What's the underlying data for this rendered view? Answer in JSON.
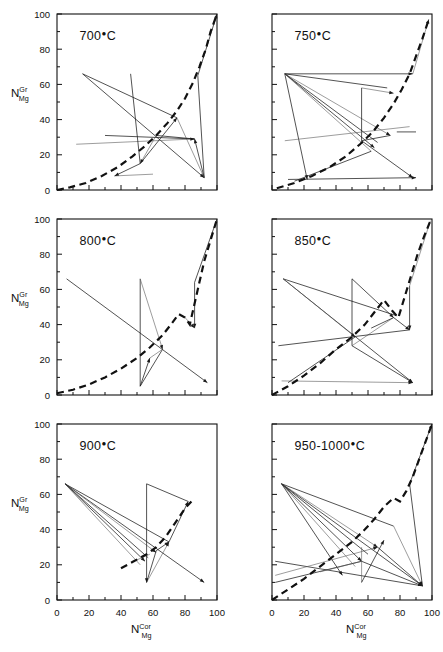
{
  "figure": {
    "axis_labels": {
      "y_base": "N",
      "y_sup": "Gr",
      "y_sub": "Mg",
      "x_base": "N",
      "x_sup": "Cor",
      "x_sub": "Mg"
    },
    "tick_values": [
      0,
      20,
      40,
      60,
      80,
      100
    ],
    "axis_range": [
      0,
      100
    ],
    "line_color": "#111111",
    "panels": [
      {
        "id": "p700",
        "label": "700",
        "unit": "°C",
        "row": 0,
        "col": 0
      },
      {
        "id": "p750",
        "label": "750",
        "unit": "°C",
        "row": 0,
        "col": 1
      },
      {
        "id": "p800",
        "label": "800",
        "unit": "°C",
        "row": 1,
        "col": 0
      },
      {
        "id": "p850",
        "label": "850",
        "unit": "°C",
        "row": 1,
        "col": 1
      },
      {
        "id": "p900",
        "label": "900",
        "unit": "°C",
        "row": 2,
        "col": 0
      },
      {
        "id": "p9501000",
        "label": "950-1000",
        "unit": "°C",
        "row": 2,
        "col": 1
      }
    ]
  },
  "chart_data": {
    "type": "scatter",
    "title": "",
    "xlabel": "N_Mg^Cor",
    "ylabel": "N_Mg^Gr",
    "xlim": [
      0,
      100
    ],
    "ylim": [
      0,
      100
    ],
    "grid": false,
    "legend": "none",
    "panels": [
      {
        "temperature_label": "700°C",
        "binodal": [
          [
            0,
            0
          ],
          [
            8,
            1.5
          ],
          [
            18,
            4
          ],
          [
            28,
            8
          ],
          [
            38,
            13
          ],
          [
            47,
            19
          ],
          [
            55,
            25
          ],
          [
            62,
            31
          ],
          [
            69,
            38
          ],
          [
            75,
            45
          ],
          [
            80,
            52
          ],
          [
            85,
            61
          ],
          [
            89,
            70
          ],
          [
            93,
            80
          ],
          [
            96,
            90
          ],
          [
            100,
            100
          ]
        ],
        "tielines": [
          [
            [
              16,
              66
            ],
            [
              92,
              7
            ]
          ],
          [
            [
              16,
              66
            ],
            [
              75,
              41
            ]
          ],
          [
            [
              12,
              26
            ],
            [
              86,
              29
            ]
          ],
          [
            [
              46,
              66
            ],
            [
              52,
              15
            ]
          ],
          [
            [
              52,
              15
            ],
            [
              75,
              41
            ]
          ],
          [
            [
              75,
              41
            ],
            [
              92,
              7
            ]
          ],
          [
            [
              92,
              7
            ],
            [
              86,
              29
            ]
          ],
          [
            [
              86,
              29
            ],
            [
              62,
              31
            ]
          ],
          [
            [
              62,
              31
            ],
            [
              52,
              15
            ]
          ],
          [
            [
              88,
              65
            ],
            [
              92,
              7
            ]
          ],
          [
            [
              88,
              65
            ],
            [
              100,
              100
            ]
          ],
          [
            [
              36,
              8
            ],
            [
              60,
              9
            ]
          ],
          [
            [
              52,
              15
            ],
            [
              36,
              8
            ]
          ],
          [
            [
              30,
              31
            ],
            [
              86,
              29
            ]
          ]
        ]
      },
      {
        "temperature_label": "750°C",
        "binodal": [
          [
            3,
            1
          ],
          [
            14,
            4
          ],
          [
            25,
            8
          ],
          [
            36,
            13
          ],
          [
            46,
            19
          ],
          [
            55,
            26
          ],
          [
            63,
            33
          ],
          [
            70,
            41
          ],
          [
            76,
            49
          ],
          [
            81,
            57
          ],
          [
            86,
            66
          ],
          [
            90,
            76
          ],
          [
            94,
            86
          ],
          [
            98,
            97
          ]
        ],
        "tielines": [
          [
            [
              8,
              66
            ],
            [
              88,
              66
            ]
          ],
          [
            [
              8,
              66
            ],
            [
              72,
              58
            ]
          ],
          [
            [
              8,
              66
            ],
            [
              74,
              31
            ]
          ],
          [
            [
              8,
              66
            ],
            [
              66,
              27
            ]
          ],
          [
            [
              8,
              66
            ],
            [
              64,
              24
            ]
          ],
          [
            [
              8,
              66
            ],
            [
              62,
              22
            ]
          ],
          [
            [
              8,
              66
            ],
            [
              22,
              6
            ]
          ],
          [
            [
              56,
              58
            ],
            [
              56,
              28
            ]
          ],
          [
            [
              56,
              58
            ],
            [
              76,
              55
            ]
          ],
          [
            [
              56,
              28
            ],
            [
              74,
              31
            ]
          ],
          [
            [
              56,
              28
            ],
            [
              88,
              7
            ]
          ],
          [
            [
              8,
              28
            ],
            [
              86,
              36
            ]
          ],
          [
            [
              10,
              6
            ],
            [
              90,
              7
            ]
          ],
          [
            [
              14,
              5
            ],
            [
              62,
              22
            ]
          ],
          [
            [
              88,
              66
            ],
            [
              98,
              97
            ]
          ],
          [
            [
              78,
              33
            ],
            [
              90,
              33
            ]
          ]
        ]
      },
      {
        "temperature_label": "800°C",
        "binodal": [
          [
            0,
            1
          ],
          [
            10,
            3
          ],
          [
            20,
            6
          ],
          [
            30,
            10
          ],
          [
            40,
            15
          ],
          [
            50,
            21
          ],
          [
            58,
            27
          ],
          [
            66,
            34
          ],
          [
            72,
            41
          ],
          [
            76,
            46
          ],
          [
            80,
            44
          ],
          [
            83,
            40
          ],
          [
            86,
            52
          ],
          [
            89,
            64
          ],
          [
            92,
            76
          ],
          [
            96,
            88
          ],
          [
            100,
            100
          ]
        ],
        "tielines": [
          [
            [
              6,
              66
            ],
            [
              94,
              7
            ]
          ],
          [
            [
              52,
              66
            ],
            [
              52,
              5
            ]
          ],
          [
            [
              52,
              66
            ],
            [
              66,
              26
            ]
          ],
          [
            [
              52,
              5
            ],
            [
              66,
              26
            ]
          ],
          [
            [
              52,
              5
            ],
            [
              58,
              21
            ]
          ],
          [
            [
              58,
              21
            ],
            [
              66,
              26
            ]
          ],
          [
            [
              86,
              64
            ],
            [
              86,
              38
            ]
          ],
          [
            [
              86,
              64
            ],
            [
              100,
              100
            ]
          ],
          [
            [
              80,
              44
            ],
            [
              86,
              38
            ]
          ]
        ]
      },
      {
        "temperature_label": "850°C",
        "binodal": [
          [
            0,
            0
          ],
          [
            10,
            5
          ],
          [
            20,
            11
          ],
          [
            30,
            18
          ],
          [
            40,
            26
          ],
          [
            50,
            33
          ],
          [
            58,
            40
          ],
          [
            64,
            47
          ],
          [
            70,
            54
          ],
          [
            75,
            48
          ],
          [
            79,
            44
          ],
          [
            83,
            56
          ],
          [
            87,
            68
          ],
          [
            91,
            80
          ],
          [
            95,
            90
          ],
          [
            99,
            99
          ]
        ],
        "tielines": [
          [
            [
              7,
              66
            ],
            [
              88,
              7
            ]
          ],
          [
            [
              7,
              66
            ],
            [
              78,
              45
            ]
          ],
          [
            [
              7,
              66
            ],
            [
              52,
              33
            ]
          ],
          [
            [
              50,
              66
            ],
            [
              50,
              28
            ]
          ],
          [
            [
              50,
              66
            ],
            [
              76,
              44
            ]
          ],
          [
            [
              50,
              28
            ],
            [
              76,
              44
            ]
          ],
          [
            [
              50,
              28
            ],
            [
              88,
              7
            ]
          ],
          [
            [
              4,
              28
            ],
            [
              86,
              37
            ]
          ],
          [
            [
              6,
              8
            ],
            [
              88,
              7
            ]
          ],
          [
            [
              10,
              7
            ],
            [
              52,
              33
            ]
          ],
          [
            [
              86,
              62
            ],
            [
              86,
              37
            ]
          ],
          [
            [
              86,
              62
            ],
            [
              99,
              99
            ]
          ],
          [
            [
              76,
              44
            ],
            [
              86,
              37
            ]
          ],
          [
            [
              62,
              38
            ],
            [
              76,
              44
            ]
          ]
        ]
      },
      {
        "temperature_label": "900°C",
        "binodal": [
          [
            40,
            18
          ],
          [
            48,
            22
          ],
          [
            56,
            26
          ],
          [
            62,
            30
          ],
          [
            68,
            36
          ],
          [
            74,
            44
          ],
          [
            80,
            52
          ],
          [
            85,
            57
          ]
        ],
        "tielines": [
          [
            [
              5,
              66
            ],
            [
              92,
              10
            ]
          ],
          [
            [
              5,
              66
            ],
            [
              70,
              33
            ]
          ],
          [
            [
              5,
              66
            ],
            [
              62,
              27
            ]
          ],
          [
            [
              5,
              66
            ],
            [
              57,
              24
            ]
          ],
          [
            [
              5,
              66
            ],
            [
              55,
              22
            ]
          ],
          [
            [
              5,
              66
            ],
            [
              52,
              20
            ]
          ],
          [
            [
              56,
              66
            ],
            [
              56,
              10
            ]
          ],
          [
            [
              56,
              66
            ],
            [
              82,
              56
            ]
          ],
          [
            [
              56,
              10
            ],
            [
              70,
              33
            ]
          ],
          [
            [
              56,
              10
            ],
            [
              62,
              28
            ]
          ],
          [
            [
              62,
              28
            ],
            [
              70,
              33
            ]
          ],
          [
            [
              48,
              22
            ],
            [
              58,
              26
            ]
          ],
          [
            [
              70,
              33
            ],
            [
              82,
              56
            ]
          ]
        ]
      },
      {
        "temperature_label": "950-1000°C",
        "binodal": [
          [
            0,
            0
          ],
          [
            10,
            6
          ],
          [
            20,
            12
          ],
          [
            30,
            19
          ],
          [
            40,
            26
          ],
          [
            50,
            33
          ],
          [
            58,
            40
          ],
          [
            64,
            46
          ],
          [
            70,
            53
          ],
          [
            76,
            58
          ],
          [
            80,
            56
          ],
          [
            84,
            62
          ],
          [
            88,
            70
          ],
          [
            92,
            80
          ],
          [
            96,
            90
          ],
          [
            100,
            100
          ]
        ],
        "tielines": [
          [
            [
              6,
              66
            ],
            [
              94,
              8
            ]
          ],
          [
            [
              6,
              66
            ],
            [
              76,
              42
            ]
          ],
          [
            [
              6,
              66
            ],
            [
              66,
              30
            ]
          ],
          [
            [
              6,
              66
            ],
            [
              60,
              26
            ]
          ],
          [
            [
              6,
              66
            ],
            [
              56,
              22
            ]
          ],
          [
            [
              6,
              66
            ],
            [
              52,
              19
            ]
          ],
          [
            [
              6,
              66
            ],
            [
              44,
              14
            ]
          ],
          [
            [
              2,
              22
            ],
            [
              94,
              8
            ]
          ],
          [
            [
              2,
              14
            ],
            [
              66,
              30
            ]
          ],
          [
            [
              2,
              10
            ],
            [
              56,
              22
            ]
          ],
          [
            [
              56,
              22
            ],
            [
              94,
              8
            ]
          ],
          [
            [
              56,
              10
            ],
            [
              56,
              30
            ]
          ],
          [
            [
              56,
              10
            ],
            [
              70,
              34
            ]
          ],
          [
            [
              66,
              30
            ],
            [
              94,
              8
            ]
          ],
          [
            [
              76,
              42
            ],
            [
              94,
              8
            ]
          ],
          [
            [
              86,
              66
            ],
            [
              94,
              8
            ]
          ],
          [
            [
              86,
              66
            ],
            [
              100,
              100
            ]
          ],
          [
            [
              30,
              16
            ],
            [
              56,
              22
            ]
          ]
        ]
      }
    ]
  }
}
